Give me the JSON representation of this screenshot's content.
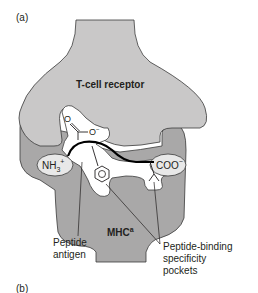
{
  "panel_labels": {
    "a": "(a)",
    "b": "(b)"
  },
  "colors": {
    "tcr_fill": "#c9c8c8",
    "mhc_fill": "#a9a8a8",
    "outline": "#3a3a3a",
    "peptide": "#000000",
    "cavity": "#ffffff"
  },
  "structures": {
    "tcr": "T-cell receptor",
    "mhc": "MHC",
    "mhc_superscript": "a"
  },
  "chem": {
    "carbonyl_o": "O",
    "carboxylate_o": "O",
    "carboxylate_charge": "−",
    "n_terminus": "NH",
    "n_sub": "3",
    "n_charge": "+",
    "c_terminus": "COO",
    "c_charge": "−"
  },
  "callouts": {
    "peptide_line1": "Peptide",
    "peptide_line2": "antigen",
    "pockets_line1": "Peptide-binding",
    "pockets_line2": "specificity",
    "pockets_line3": "pockets"
  }
}
